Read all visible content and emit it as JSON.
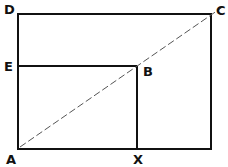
{
  "diagram": {
    "type": "geometric-rectangles",
    "colors": {
      "line": "#111111",
      "background": "#ffffff",
      "dashed": "#555555"
    },
    "points": {
      "A": {
        "label": "A",
        "x": 18,
        "y": 149
      },
      "X": {
        "label": "X",
        "x": 137,
        "y": 149
      },
      "B": {
        "label": "B",
        "x": 137,
        "y": 66
      },
      "E": {
        "label": "E",
        "x": 18,
        "y": 66
      },
      "D": {
        "label": "D",
        "x": 18,
        "y": 14
      },
      "C": {
        "label": "C",
        "x": 211,
        "y": 14
      }
    },
    "labels": {
      "A": "A",
      "X": "X",
      "B": "B",
      "E": "E",
      "D": "D",
      "C": "C"
    },
    "shapes": [
      {
        "name": "outer-rectangle",
        "corners": [
          "A",
          "D",
          "C",
          "bottom-right"
        ]
      },
      {
        "name": "inner-rectangle",
        "corners": [
          "A",
          "E",
          "B",
          "X"
        ]
      },
      {
        "name": "diagonal",
        "from": "A",
        "to": "C",
        "style": "dashed",
        "passes_through": "B"
      }
    ]
  }
}
